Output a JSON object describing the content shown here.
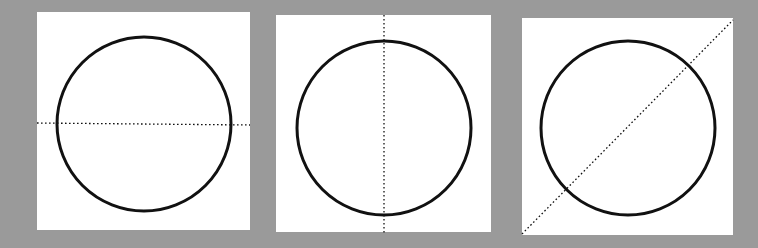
{
  "background_color": "#9a9a9a",
  "panel_color": "#ffffff",
  "stroke_color": "#111111",
  "panels": [
    {
      "name": "horizontal-diameter",
      "box": {
        "x": 37,
        "y": 12,
        "w": 213,
        "h": 218
      },
      "circle": {
        "cx": 107,
        "cy": 112,
        "r": 87
      },
      "line": {
        "x1": 0,
        "y1": 111,
        "x2": 213,
        "y2": 113,
        "style": "dotted"
      }
    },
    {
      "name": "vertical-diameter",
      "box": {
        "x": 276,
        "y": 15,
        "w": 215,
        "h": 217
      },
      "circle": {
        "cx": 108,
        "cy": 113,
        "r": 87
      },
      "line": {
        "x1": 108,
        "y1": 0,
        "x2": 108,
        "y2": 219,
        "style": "dotted"
      }
    },
    {
      "name": "diagonal-line",
      "box": {
        "x": 522,
        "y": 18,
        "w": 211,
        "h": 217
      },
      "circle": {
        "cx": 106,
        "cy": 110,
        "r": 87
      },
      "line": {
        "x1": 0,
        "y1": 216,
        "x2": 211,
        "y2": 2,
        "style": "dotted"
      }
    }
  ]
}
